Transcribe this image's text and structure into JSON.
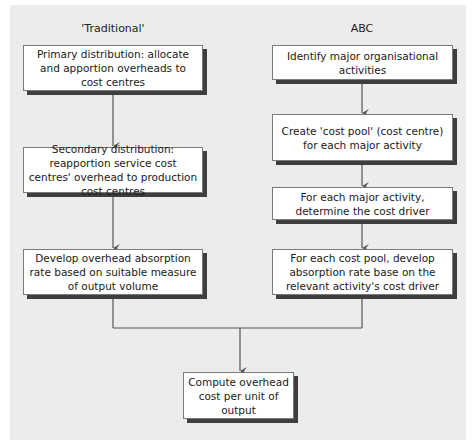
{
  "diagram": {
    "columns": {
      "traditional": {
        "label": "'Traditional'",
        "steps": [
          "Primary distribution: allocate and apportion overheads to cost centres",
          "Secondary distribution: reapportion service cost centres' overhead to production cost centres",
          "Develop overhead absorption rate based on suitable measure of output volume"
        ]
      },
      "abc": {
        "label": "ABC",
        "steps": [
          "Identify major organisational activities",
          "Create 'cost pool' (cost centre) for each major activity",
          "For each major activity, determine the cost driver",
          "For each cost pool, develop absorption rate base on the relevant activity's cost driver"
        ]
      }
    },
    "final_step": "Compute overhead cost per unit of output",
    "colors": {
      "panel_background": "#ececec",
      "box_fill": "#ffffff",
      "box_shadow": "#3e3e3e",
      "line": "#555555"
    }
  }
}
